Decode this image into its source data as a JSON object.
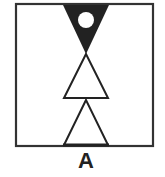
{
  "figure": {
    "label": "A",
    "frame": {
      "x": 15,
      "y": 4,
      "width": 138,
      "height": 142,
      "stroke": "#333333"
    },
    "shapes": [
      {
        "type": "inverted-triangle",
        "fill": "#222222",
        "contains": "white-circle"
      },
      {
        "type": "triangle",
        "fill": "#ffffff",
        "stroke": "#222222"
      },
      {
        "type": "triangle",
        "fill": "#ffffff",
        "stroke": "#222222"
      }
    ]
  }
}
